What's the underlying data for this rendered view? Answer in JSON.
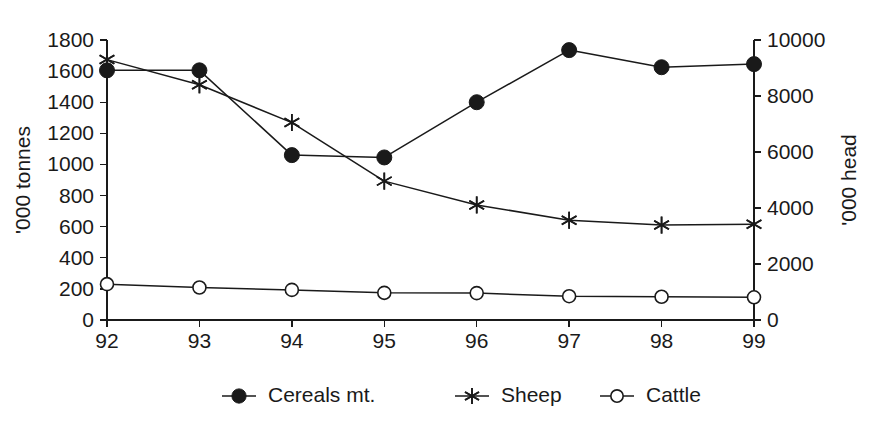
{
  "chart_data": {
    "type": "line",
    "title": "",
    "subtitle": "",
    "xlabel": "",
    "ylabel": "'000 tonnes",
    "y2label": "'000 head",
    "categories": [
      "92",
      "93",
      "94",
      "95",
      "96",
      "97",
      "98",
      "99"
    ],
    "x": [
      92,
      93,
      94,
      95,
      96,
      97,
      98,
      99
    ],
    "ylim": [
      0,
      1800
    ],
    "y2lim": [
      0,
      10000
    ],
    "yticks": [
      0,
      200,
      400,
      600,
      800,
      1000,
      1200,
      1400,
      1600,
      1800
    ],
    "y2ticks": [
      0,
      2000,
      4000,
      6000,
      8000,
      10000
    ],
    "grid": false,
    "legend_position": "bottom-center",
    "series": [
      {
        "name": "Cereals mt.",
        "axis": "left",
        "marker": "filled-circle",
        "color": "#1a1a1a",
        "values": [
          1605,
          1605,
          1060,
          1045,
          1400,
          1735,
          1625,
          1645
        ]
      },
      {
        "name": "Sheep",
        "axis": "right",
        "marker": "asterisk",
        "color": "#1a1a1a",
        "values": [
          9300,
          8400,
          7050,
          4960,
          4110,
          3560,
          3390,
          3420
        ]
      },
      {
        "name": "Cattle",
        "axis": "right",
        "marker": "open-circle",
        "color": "#1a1a1a",
        "values": [
          1280,
          1160,
          1075,
          970,
          960,
          850,
          830,
          810
        ]
      }
    ]
  },
  "axes": {
    "left_title": "'000 tonnes",
    "right_title": "'000 head",
    "left_ticks": [
      "0",
      "200",
      "400",
      "600",
      "800",
      "1000",
      "1200",
      "1400",
      "1600",
      "1800"
    ],
    "right_ticks": [
      "0",
      "2000",
      "4000",
      "6000",
      "8000",
      "10000"
    ],
    "x_ticks": [
      "92",
      "93",
      "94",
      "95",
      "96",
      "97",
      "98",
      "99"
    ]
  },
  "legend": {
    "items": [
      {
        "label": "Cereals mt.",
        "marker": "filled-circle"
      },
      {
        "label": "Sheep",
        "marker": "asterisk"
      },
      {
        "label": "Cattle",
        "marker": "open-circle"
      }
    ]
  },
  "colors": {
    "ink": "#1a1a1a",
    "background": "#ffffff"
  }
}
